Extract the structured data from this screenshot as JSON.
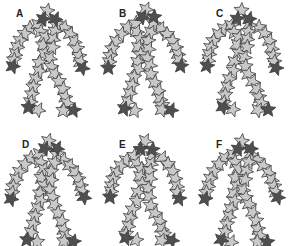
{
  "figure": {
    "colors": {
      "light_star": "#c9c9c9",
      "dark_star": "#4f4f4f",
      "outline": "#3a3a3a",
      "background": "#ffffff"
    },
    "panels": [
      {
        "label": "A",
        "x": 0,
        "y": 0,
        "label_x": 16,
        "label_y": 8,
        "jitter": 0
      },
      {
        "label": "B",
        "x": 97,
        "y": 0,
        "label_x": 22,
        "label_y": 8,
        "jitter": 1
      },
      {
        "label": "C",
        "x": 194,
        "y": 0,
        "label_x": 22,
        "label_y": 8,
        "jitter": 2
      },
      {
        "label": "D",
        "x": 0,
        "y": 123,
        "label_x": 22,
        "label_y": 16,
        "jitter": 3
      },
      {
        "label": "E",
        "x": 97,
        "y": 123,
        "label_x": 22,
        "label_y": 16,
        "jitter": 4
      },
      {
        "label": "F",
        "x": 194,
        "y": 123,
        "label_x": 22,
        "label_y": 16,
        "jitter": 5
      }
    ],
    "figure_description": "Human-like figure composed of overlapping five-pointed stars; dark stars mark head, hands and feet"
  }
}
